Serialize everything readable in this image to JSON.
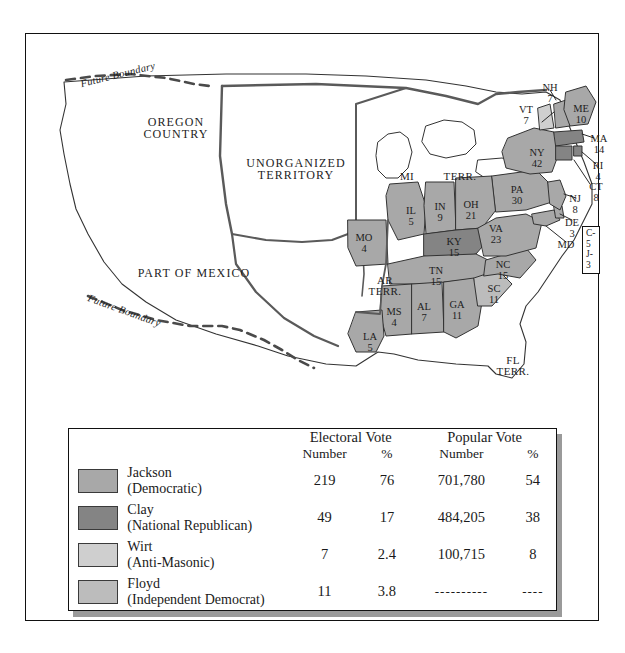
{
  "figure": {
    "type": "electoral-map-with-legend",
    "election": "1832 United States presidential election"
  },
  "map": {
    "territory_labels": [
      {
        "id": "oregon-country",
        "text": "OREGON\nCOUNTRY",
        "x": 150,
        "y": 96,
        "size": "big"
      },
      {
        "id": "unorganized-territory",
        "text": "UNORGANIZED\nTERRITORY",
        "x": 270,
        "y": 137,
        "size": "big"
      },
      {
        "id": "part-of-mexico",
        "text": "PART OF MEXICO",
        "x": 168,
        "y": 239,
        "size": "big"
      },
      {
        "id": "michigan",
        "text": "MI",
        "x": 381,
        "y": 143,
        "size": "terr"
      },
      {
        "id": "michigan-terr",
        "text": "TERR.",
        "x": 434,
        "y": 143,
        "size": "terr"
      },
      {
        "id": "arkansas-terr",
        "text": "AR\nTERR.",
        "x": 359,
        "y": 249,
        "size": "terr"
      },
      {
        "id": "florida-terr",
        "text": "FL\nTERR.",
        "x": 487,
        "y": 329,
        "size": "terr"
      }
    ],
    "future_boundary_labels": [
      {
        "id": "future-boundary-north",
        "text": "Future Boundary",
        "x": 82,
        "y": 50,
        "rot": -13
      },
      {
        "id": "future-boundary-south",
        "text": "Future Boundary",
        "x": 88,
        "y": 283,
        "rot": 19
      }
    ],
    "states": [
      {
        "code": "ME",
        "votes": "10",
        "x": 555,
        "y": 76,
        "winner": "jackson"
      },
      {
        "code": "NH",
        "votes": "7",
        "x": 524,
        "y": 55,
        "winner": "jackson"
      },
      {
        "code": "VT",
        "votes": "7",
        "x": 500,
        "y": 77,
        "winner": "wirt"
      },
      {
        "code": "MA",
        "votes": "14",
        "x": 573,
        "y": 106,
        "winner": "clay"
      },
      {
        "code": "RI",
        "votes": "4",
        "x": 572,
        "y": 133,
        "winner": "clay"
      },
      {
        "code": "CT",
        "votes": "8",
        "x": 570,
        "y": 154,
        "winner": "clay"
      },
      {
        "code": "NY",
        "votes": "42",
        "x": 511,
        "y": 120,
        "winner": "jackson"
      },
      {
        "code": "NJ",
        "votes": "8",
        "x": 549,
        "y": 166,
        "winner": "jackson"
      },
      {
        "code": "PA",
        "votes": "30",
        "x": 491,
        "y": 157,
        "winner": "jackson"
      },
      {
        "code": "DE",
        "votes": "3",
        "x": 546,
        "y": 190,
        "winner": "jackson"
      },
      {
        "code": "MD",
        "votes": "",
        "x": 540,
        "y": 212,
        "winner": "split"
      },
      {
        "code": "VA",
        "votes": "23",
        "x": 470,
        "y": 196,
        "winner": "jackson"
      },
      {
        "code": "NC",
        "votes": "15",
        "x": 477,
        "y": 232,
        "winner": "jackson"
      },
      {
        "code": "SC",
        "votes": "11",
        "x": 468,
        "y": 256,
        "winner": "floyd"
      },
      {
        "code": "GA",
        "votes": "11",
        "x": 431,
        "y": 272,
        "winner": "jackson"
      },
      {
        "code": "AL",
        "votes": "7",
        "x": 398,
        "y": 274,
        "winner": "jackson"
      },
      {
        "code": "MS",
        "votes": "4",
        "x": 368,
        "y": 279,
        "winner": "jackson"
      },
      {
        "code": "LA",
        "votes": "5",
        "x": 344,
        "y": 304,
        "winner": "jackson"
      },
      {
        "code": "TN",
        "votes": "15",
        "x": 410,
        "y": 238,
        "winner": "jackson"
      },
      {
        "code": "KY",
        "votes": "15",
        "x": 428,
        "y": 209,
        "winner": "clay"
      },
      {
        "code": "OH",
        "votes": "21",
        "x": 445,
        "y": 172,
        "winner": "jackson"
      },
      {
        "code": "IN",
        "votes": "9",
        "x": 414,
        "y": 174,
        "winner": "jackson"
      },
      {
        "code": "IL",
        "votes": "5",
        "x": 385,
        "y": 178,
        "winner": "jackson"
      },
      {
        "code": "MO",
        "votes": "4",
        "x": 338,
        "y": 205,
        "winner": "jackson"
      }
    ],
    "maryland_box": {
      "line1": "C-5",
      "line2": "J-3",
      "x": 565,
      "y": 200
    }
  },
  "legend": {
    "headers": {
      "electoral_vote": "Electoral Vote",
      "popular_vote": "Popular Vote",
      "number": "Number",
      "percent": "%"
    },
    "rows": [
      {
        "candidate": "Jackson",
        "party": "(Democratic)",
        "electoral_number": "219",
        "electoral_percent": "76",
        "popular_number": "701,780",
        "popular_percent": "54",
        "color": "#a8a8a8"
      },
      {
        "candidate": "Clay",
        "party": "(National Republican)",
        "electoral_number": "49",
        "electoral_percent": "17",
        "popular_number": "484,205",
        "popular_percent": "38",
        "color": "#848484"
      },
      {
        "candidate": "Wirt",
        "party": "(Anti-Masonic)",
        "electoral_number": "7",
        "electoral_percent": "2.4",
        "popular_number": "100,715",
        "popular_percent": "8",
        "color": "#cfcfcf"
      },
      {
        "candidate": "Floyd",
        "party": "(Independent Democrat)",
        "electoral_number": "11",
        "electoral_percent": "3.8",
        "popular_number": "----------",
        "popular_percent": "----",
        "color": "#bcbcbc"
      }
    ]
  },
  "colors": {
    "jackson": "#a8a8a8",
    "clay": "#848484",
    "wirt": "#cfcfcf",
    "floyd": "#bcbcbc",
    "unshaded": "#ffffff",
    "outline": "#333333",
    "heavy_outline": "#5a5a5a",
    "frame": "#111111",
    "shadow": "#9a9a9a"
  }
}
